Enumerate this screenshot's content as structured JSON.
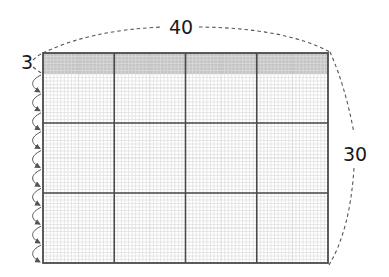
{
  "diagram": {
    "grid": {
      "columns_major": 4,
      "rows_major": 3,
      "width_units": 40,
      "height_units": 30,
      "minor_per_unit": 2
    },
    "shaded_strip": {
      "height_units": 3,
      "color": "#c4c4c4"
    },
    "labels": {
      "top": "40",
      "right": "30",
      "left": "3"
    },
    "arrow_count": 10,
    "colors": {
      "major_line": "#4a4a4a",
      "minor_line": "#dcdcdc",
      "minor_line_strong": "#c8c8c8",
      "dashed": "#555555",
      "arrow": "#555555"
    }
  }
}
